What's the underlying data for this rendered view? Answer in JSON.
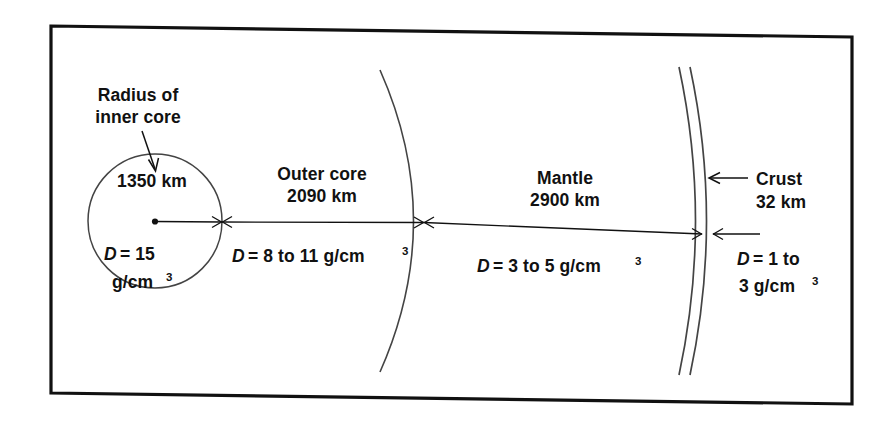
{
  "figure": {
    "kind": "cross-section-diagram",
    "background_color": "#ffffff",
    "ink_color": "#111111",
    "frame": {
      "name": "figure-border",
      "color": "#111111",
      "corners_px": {
        "top_left": [
          51,
          26
        ],
        "top_right": [
          852,
          37
        ],
        "bottom_right": [
          852,
          404
        ],
        "bottom_left": [
          51,
          393
        ]
      }
    }
  },
  "annotations": {
    "radius_callout": {
      "line1": "Radius of",
      "line2": "inner core",
      "arrow": "arrow-down-right"
    },
    "crust_callout": {
      "arrow": "arrow-left",
      "label": "Crust"
    }
  },
  "layers": [
    {
      "id": "inner-core",
      "name": "Inner core",
      "shape": "circle",
      "thickness_label": "1350 km",
      "density_symbol": "D",
      "density_equals": "=",
      "density_value": "15",
      "density_unit": "g/cm",
      "density_unit_exponent": "3",
      "density_text": "D = 15 g/cm3",
      "center_px": [
        155,
        221
      ],
      "radius_px": 67
    },
    {
      "id": "outer-core",
      "name": "Outer core",
      "thickness_label": "2090 km",
      "density_symbol": "D",
      "density_equals": "=",
      "density_value": "8 to 11",
      "density_unit": "g/cm",
      "density_unit_exponent": "3",
      "density_text": "D = 8 to 11 g/cm3",
      "span_px": [
        222,
        424
      ]
    },
    {
      "id": "mantle",
      "name": "Mantle",
      "thickness_label": "2900 km",
      "density_symbol": "D",
      "density_equals": "=",
      "density_value": "3 to 5",
      "density_unit": "g/cm",
      "density_unit_exponent": "3",
      "density_text": "D = 3 to 5 g/cm3",
      "span_px": [
        424,
        702
      ]
    },
    {
      "id": "crust",
      "name": "Crust",
      "thickness_label": "32 km",
      "density_symbol": "D",
      "density_equals": "=",
      "density_value_line1": "1 to",
      "density_value_line2": "3",
      "density_unit": "g/cm",
      "density_unit_exponent": "3",
      "density_text": "D = 1 to 3 g/cm3",
      "span_px": [
        702,
        713
      ]
    }
  ],
  "text_tokens": {
    "radius_line1": "Radius of",
    "radius_line2": "inner core",
    "inner_core_thickness": "1350 km",
    "inner_core_d": "D",
    "inner_core_eq_val": "= 15",
    "inner_core_unit": "g/cm",
    "outer_core_name": "Outer core",
    "outer_core_thickness": "2090 km",
    "outer_core_d": "D",
    "outer_core_eq_val": "= 8 to 11 g/cm",
    "mantle_name": "Mantle",
    "mantle_thickness": "2900 km",
    "mantle_d": "D",
    "mantle_eq_val": "= 3 to 5 g/cm",
    "crust_name": "Crust",
    "crust_thickness": "32 km",
    "crust_d": "D",
    "crust_eq_val": "= 1 to",
    "crust_val2_unit": "3 g/cm",
    "exponent": "3"
  }
}
